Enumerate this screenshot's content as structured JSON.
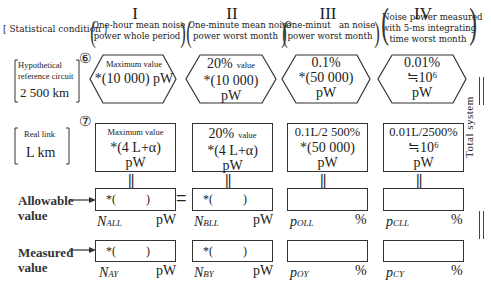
{
  "header": {
    "statistical_condition_label": "Statistical condition",
    "columns": [
      {
        "numeral": "I",
        "condition_line1": "One-hour mean noise",
        "condition_line2": "power whole period"
      },
      {
        "numeral": "II",
        "condition_line1": "One-minute mean noise",
        "condition_line2": "power worst month"
      },
      {
        "numeral": "III",
        "condition_line1": "One-minut   an noise",
        "condition_line2": "power worst month"
      },
      {
        "numeral": "IV",
        "condition_line1": "Noise power measured",
        "condition_line2": "with 5-ms integrating",
        "condition_line3": "time worst month"
      }
    ]
  },
  "hypothetical": {
    "label_line1": "Hypothetical",
    "label_line2": "reference circuit",
    "label_line3": "2 500 km",
    "marker": "⑥",
    "cells": [
      {
        "line1": "Maximum value",
        "line2": "*(10 000) pW",
        "line3": ""
      },
      {
        "line1_big": "20%",
        "line1_small": "value",
        "line2": "*(10 000)",
        "line3": "pW"
      },
      {
        "line1": "0.1%",
        "line2": "*(50 000)",
        "line3": "pW"
      },
      {
        "line1": "0.01%",
        "line2": "≒10⁶",
        "line3": "pW"
      }
    ]
  },
  "real_link": {
    "label_line1": "Real link",
    "label_line2": "L km",
    "marker": "⑦",
    "cells": [
      {
        "line1": "Maximum value",
        "line2": "*(4 L+α)",
        "line3": "pW"
      },
      {
        "line1_big": "20%",
        "line1_small": "value",
        "line2": "*(4 L+α)",
        "line3": "pW"
      },
      {
        "line1": "0.1L/2 500%",
        "line2": "*(50 000)",
        "line3": "pW"
      },
      {
        "line1": "0.01L/2500%",
        "line2": "≒10⁶",
        "line3": "pW"
      }
    ]
  },
  "allowable": {
    "label_line1": "Allowable",
    "label_line2": "value",
    "equals_symbol": "=",
    "cells": [
      {
        "content": "*(          )",
        "symbol": "N",
        "subscript": "ALL",
        "unit": "pW"
      },
      {
        "content": "*(          )",
        "symbol": "N",
        "subscript": "BLL",
        "unit": "pW"
      },
      {
        "content": "",
        "symbol": "p",
        "subscript": "OLL",
        "unit": "%"
      },
      {
        "content": "",
        "symbol": "p",
        "subscript": "CLL",
        "unit": "%"
      }
    ]
  },
  "measured": {
    "label_line1": "Measured",
    "label_line2": "value",
    "cells": [
      {
        "content": "*(          )",
        "symbol": "N",
        "subscript": "AY",
        "unit": "pW"
      },
      {
        "content": "*(          )",
        "symbol": "N",
        "subscript": "BY",
        "unit": "pW"
      },
      {
        "content": "",
        "symbol": "p",
        "subscript": "OY",
        "unit": "%"
      },
      {
        "content": "",
        "symbol": "p",
        "subscript": "CY",
        "unit": "%"
      }
    ]
  },
  "side": {
    "total_system_label": "Total system",
    "connector_symbol": "||"
  }
}
